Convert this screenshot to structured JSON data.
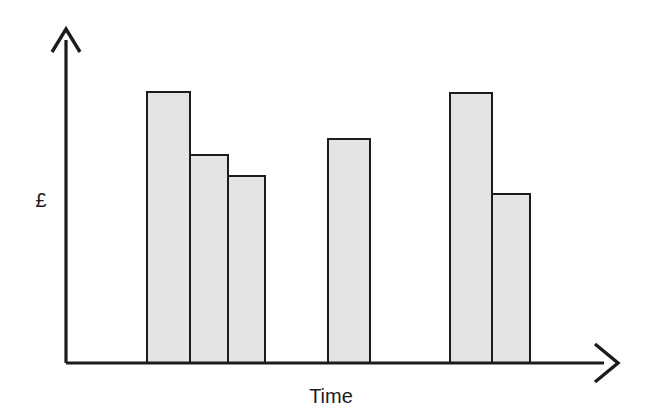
{
  "chart_data": {
    "type": "bar",
    "title": "",
    "subtitle": "",
    "xlabel": "Time",
    "ylabel": "£",
    "categories": [
      "1",
      "2",
      "3",
      "4",
      "5",
      "6"
    ],
    "values": [
      100,
      77,
      69,
      83,
      100,
      62
    ],
    "ylim": [
      0,
      100
    ],
    "xlim": [
      0,
      100
    ],
    "grid": false,
    "legend": null,
    "axis_ticks": {
      "x": [],
      "y": []
    },
    "annotations": [],
    "bar_fill_color": "#e4e4e4",
    "bar_stroke_color": "#1c1c1c",
    "axis_color": "#1c1c1c",
    "background_color": "#ffffff",
    "bars": [
      {
        "id": "bar-1",
        "group": 1,
        "value": 100,
        "x": 147,
        "width": 43,
        "top": 92
      },
      {
        "id": "bar-2",
        "group": 1,
        "value": 77,
        "x": 190,
        "width": 38,
        "top": 155
      },
      {
        "id": "bar-3",
        "group": 1,
        "value": 69,
        "x": 228,
        "width": 37,
        "top": 176
      },
      {
        "id": "bar-4",
        "group": 2,
        "value": 83,
        "x": 328,
        "width": 42,
        "top": 139
      },
      {
        "id": "bar-5",
        "group": 3,
        "value": 100,
        "x": 450,
        "width": 42,
        "top": 93
      },
      {
        "id": "bar-6",
        "group": 3,
        "value": 62,
        "x": 492,
        "width": 38,
        "top": 194
      }
    ],
    "geometry": {
      "origin_x": 66,
      "baseline_y": 363,
      "y_axis_top_y": 28,
      "x_axis_end_x": 618
    }
  },
  "labels": {
    "y_axis": "£",
    "x_axis": "Time"
  }
}
